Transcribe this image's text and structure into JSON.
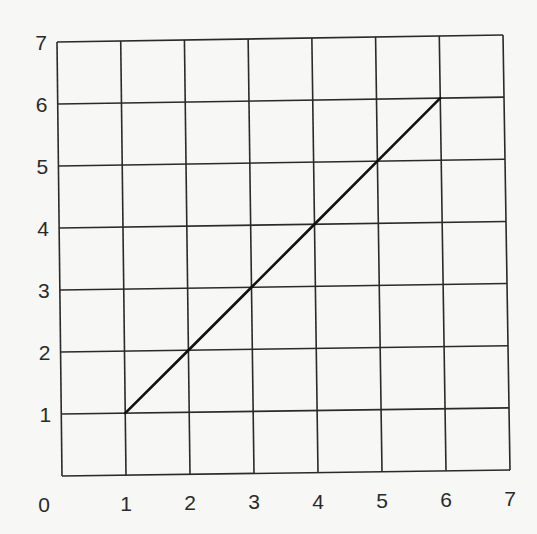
{
  "chart_data": {
    "type": "line",
    "title": "",
    "xlabel": "",
    "ylabel": "",
    "xlim": [
      0,
      7
    ],
    "ylim": [
      0,
      7
    ],
    "grid": true,
    "legend": null,
    "x_tick_labels": [
      "0",
      "1",
      "2",
      "3",
      "4",
      "5",
      "6",
      "7"
    ],
    "y_tick_labels": [
      "1",
      "2",
      "3",
      "4",
      "5",
      "6",
      "7"
    ],
    "series": [
      {
        "name": "line",
        "x": [
          1,
          2,
          3,
          4,
          5,
          6
        ],
        "y": [
          1,
          2,
          3,
          4,
          5,
          6
        ]
      }
    ],
    "colors": {
      "line": "#111111",
      "grid": "#2a2a2a",
      "background": "#f7f7f5"
    }
  }
}
